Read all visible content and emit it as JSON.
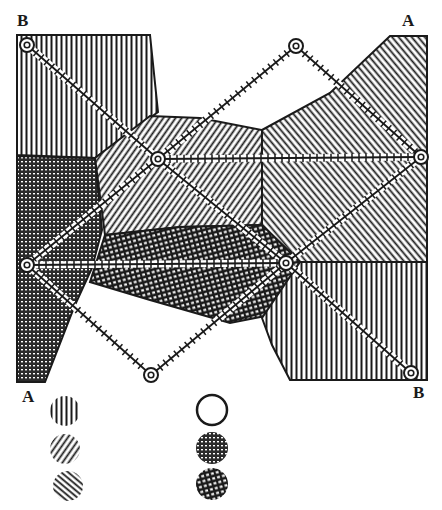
{
  "figure": {
    "ink_color": "#1a1a1a",
    "paper_color": "#ffffff",
    "labels": [
      {
        "id": "label-B-top-left",
        "text": "B",
        "x": 17,
        "y": 12
      },
      {
        "id": "label-A-top-right",
        "text": "A",
        "x": 402,
        "y": 12
      },
      {
        "id": "label-A-bottom-left",
        "text": "A",
        "x": 22,
        "y": 388
      },
      {
        "id": "label-B-bottom-right",
        "text": "B",
        "x": 413,
        "y": 384
      }
    ],
    "points": [
      {
        "id": "P1",
        "x": 27,
        "y": 45
      },
      {
        "id": "P2",
        "x": 296,
        "y": 46
      },
      {
        "id": "P3",
        "x": 421,
        "y": 157
      },
      {
        "id": "P4",
        "x": 158,
        "y": 159
      },
      {
        "id": "P5",
        "x": 27,
        "y": 265
      },
      {
        "id": "P6",
        "x": 286,
        "y": 263
      },
      {
        "id": "P7",
        "x": 151,
        "y": 375
      },
      {
        "id": "P8",
        "x": 411,
        "y": 373
      }
    ],
    "lines": [
      [
        "P1",
        "P4"
      ],
      [
        "P4",
        "P6"
      ],
      [
        "P6",
        "P8"
      ],
      [
        "P2",
        "P3"
      ],
      [
        "P2",
        "P4"
      ],
      [
        "P4",
        "P3"
      ],
      [
        "P4",
        "P5"
      ],
      [
        "P5",
        "P6"
      ],
      [
        "P5",
        "P7"
      ],
      [
        "P7",
        "P6"
      ],
      [
        "P6",
        "P3"
      ]
    ],
    "legend": {
      "left_column": [
        "vertical-hatch",
        "diagonal-hatch-right",
        "diagonal-hatch-left"
      ],
      "right_column": [
        "empty-circle",
        "dense-crosshatch",
        "open-crosshatch"
      ]
    }
  }
}
